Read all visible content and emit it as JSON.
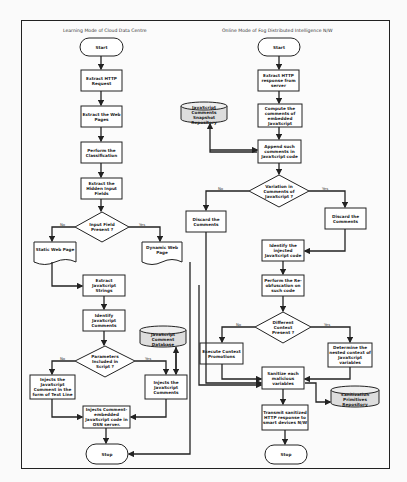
{
  "titles": {
    "left": "Learning Mode of Cloud Data Centre",
    "right": "Online Mode of Fog Distributed Intelligence N/W"
  },
  "left": {
    "start": "Start",
    "extract_http": "Extract HTTP Request",
    "extract_pages": "Extract the Web Pages",
    "classification": "Perform the Classification",
    "hidden_fields": "Extract the Hidden Input Fields",
    "decision_input": "Input Field Present ?",
    "static_page": "Static Web Page",
    "dynamic_page": "Dynamic Web Page",
    "extract_strings": "Extract JavaScript Strings",
    "identify_comments": "Identify JavaScript Comments",
    "decision_params": "Parameters Included in Script ?",
    "inject_text_line": "Injects the JavaScript Comment in the form of Text Line",
    "inject_comments": "Injects the JavaScript Comments",
    "comment_db": "JavaScript Comment Database",
    "inject_embedded": "Injects Comment-embedded JavaScript code in OSN server.",
    "stop": "Stop"
  },
  "right": {
    "start": "Start",
    "extract_response": "Extract HTTP response from server",
    "compute_comments": "Compute the comments of embedded JavaScript",
    "snapshot_repo": "JavaScript Comments Snapshot Repository",
    "append_comments": "Append such comments in JavaScript code",
    "decision_variation": "Variation in Comments of JavaScript ?",
    "discard_left": "Discard the Comments",
    "discard_right": "Discard the Comments",
    "identify_injected": "Identify the injected JavaScript code",
    "re_obfuscation": "Perform the Re-obfuscation on such code",
    "decision_context": "Different Context Present ?",
    "execute_promotions": "Execute Context Promotions",
    "determine_context": "Determine the nested context of JavaScript variables",
    "sanitize": "Sanitize each malicious variables",
    "sanitization_repo": "Sanitization Primitives Repository",
    "transmit": "Transmit sanitized HTTP response to smart devices N/W",
    "stop": "Stop"
  },
  "branch": {
    "no": "No",
    "yes": "Yes"
  }
}
